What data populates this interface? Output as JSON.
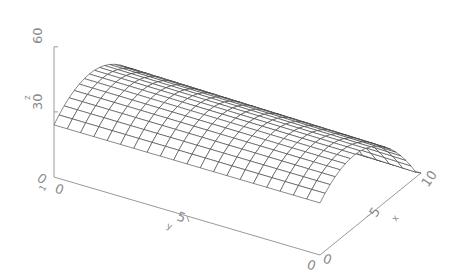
{
  "chart_data": {
    "type": "surface",
    "title": "",
    "xlabel": "x",
    "ylabel": "y",
    "zlabel": "z",
    "x_range": [
      0,
      10
    ],
    "y_range": [
      0,
      10
    ],
    "z_range": [
      0,
      60
    ],
    "x_ticks": [
      "0",
      "5",
      "10"
    ],
    "y_ticks": [
      "0",
      "5",
      "10"
    ],
    "z_ticks": [
      "0",
      "30",
      "60"
    ],
    "grid_size": [
      20,
      20
    ],
    "style": "wireframe mesh, hidden lines removed"
  },
  "colors": {
    "axis": "#9a9a9a",
    "mesh": "#3a3a3a",
    "background": "#ffffff"
  }
}
